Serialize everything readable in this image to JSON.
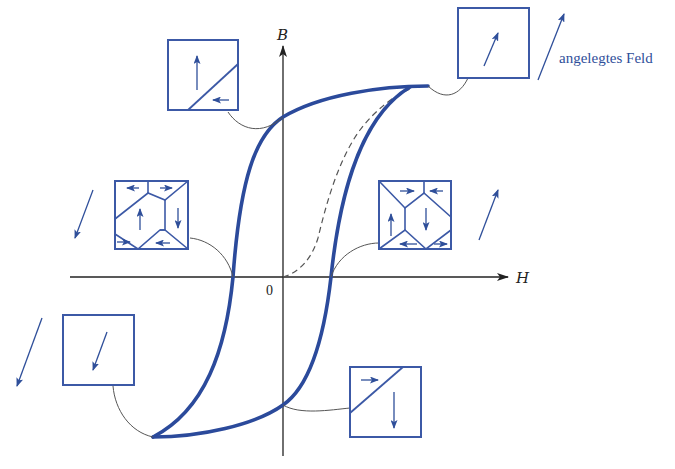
{
  "diagram": {
    "type": "magnetic-hysteresis-loop",
    "axes": {
      "x_label": "H",
      "y_label": "B",
      "origin_label": "0"
    },
    "legend": {
      "applied_field_label": "angelegtes Feld"
    },
    "curves": {
      "hysteresis_loop": {
        "style": "solid-thick",
        "color": "#2b4a9b"
      },
      "initial_magnetization": {
        "style": "dashed",
        "color": "#555555"
      }
    },
    "domain_boxes": [
      {
        "id": "saturation-positive",
        "position": "top-right",
        "description": "single domain, magnetization along applied field (up-right)"
      },
      {
        "id": "remanence-positive",
        "position": "top-left",
        "description": "large domain pointing up, small domain pointing left"
      },
      {
        "id": "coercive-negative",
        "position": "middle-left",
        "description": "multi-domain closure pattern, net zero"
      },
      {
        "id": "coercive-positive",
        "position": "middle-right",
        "description": "multi-domain closure pattern, net zero"
      },
      {
        "id": "saturation-negative",
        "position": "bottom-left",
        "description": "single domain pointing down-left"
      },
      {
        "id": "remanence-negative",
        "position": "bottom-right",
        "description": "large domain pointing down, small domain pointing right"
      }
    ],
    "field_arrows": [
      {
        "position": "top-right",
        "direction": "up-right"
      },
      {
        "position": "middle-right",
        "direction": "up-right"
      },
      {
        "position": "middle-left",
        "direction": "down-left"
      },
      {
        "position": "bottom-left",
        "direction": "down-left"
      }
    ],
    "colors": {
      "loop": "#2b4a9b",
      "box_stroke": "#3c59a6",
      "arrow": "#2f4f9a",
      "axis": "#222222",
      "leader": "#555555"
    }
  }
}
